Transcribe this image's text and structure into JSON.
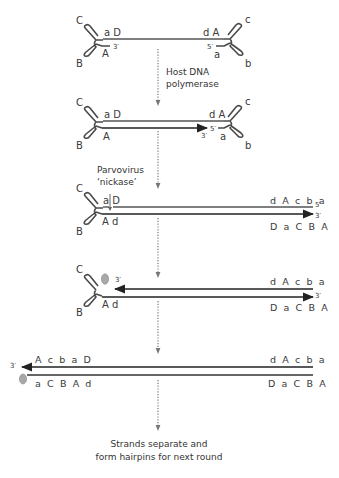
{
  "colors": {
    "strand": "#555555",
    "new_strand": "#222222",
    "hairpin": "#4a4a4a",
    "dotted_arrow": "#666666",
    "protein": "#a8a8a8",
    "text": "#3a3a3a"
  },
  "steps": [
    {
      "id": "step1",
      "left_hairpin": {
        "top_label": "C",
        "bottom_label": "B"
      },
      "right_hairpin": {
        "top_label": "c",
        "bottom_label": "b"
      },
      "top_left_seq": "a D",
      "top_right_seq": "d A",
      "bottom_left_seq": "A",
      "bottom_left_end": "3′",
      "bottom_right_seq": "a",
      "bottom_right_end": "5′"
    },
    {
      "id": "step2",
      "left_hairpin": {
        "top_label": "C",
        "bottom_label": "B"
      },
      "right_hairpin": {
        "top_label": "c",
        "bottom_label": "b"
      },
      "top_left_seq": "a D",
      "top_right_seq": "d A",
      "bottom_left_seq": "A",
      "arrow_end": "3′",
      "bottom_right_end": "5′",
      "bottom_right_seq": "a"
    },
    {
      "id": "step3",
      "left_hairpin": {
        "top_label": "C",
        "bottom_label": "B"
      },
      "top_left_seq": "a D",
      "bottom_left_seq": "A d",
      "top_right_seq": "d A c b a",
      "top_right_end": "5′",
      "bottom_right_end": "3′",
      "bottom_right_seq": "D a C B A"
    },
    {
      "id": "step4",
      "left_hairpin": {
        "top_label": "C",
        "bottom_label": "B"
      },
      "top_left_end": "3′",
      "bottom_left_seq": "A d",
      "top_right_seq": "d A c b a",
      "bottom_right_end": "3′",
      "bottom_right_seq": "D a C B A"
    },
    {
      "id": "step5",
      "top_left_end": "3′",
      "top_left_seq": "A c b a D",
      "bottom_left_seq": "a C B A d",
      "top_right_seq": "d A c b a",
      "bottom_right_seq": "D a C B A"
    }
  ],
  "transitions": [
    {
      "label_line1": "Host DNA",
      "label_line2": "polymerase"
    },
    {
      "label_line1": "Parvovirus",
      "label_line2": "‘nickase’"
    },
    {
      "label_line1": "",
      "label_line2": ""
    },
    {
      "label_line1": "",
      "label_line2": ""
    }
  ],
  "caption": {
    "line1": "Strands separate and",
    "line2": "form hairpins for next round"
  }
}
